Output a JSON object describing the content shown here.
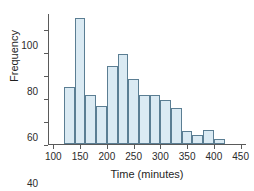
{
  "chart_data": {
    "type": "bar",
    "title": "",
    "subtitle": "",
    "xlabel": "Time (minutes)",
    "ylabel": "Frequency",
    "xlim": [
      90,
      460
    ],
    "ylim": [
      0,
      114
    ],
    "grid": false,
    "legend": null,
    "bin_width": 20,
    "xticks": [
      100,
      150,
      200,
      250,
      300,
      350,
      400,
      450
    ],
    "yticks": [
      0,
      20,
      40,
      60,
      80,
      100
    ],
    "xtick_labels": [
      "100",
      "150",
      "200",
      "250",
      "300",
      "350",
      "400",
      "450"
    ],
    "ytick_labels": [
      "0",
      "20",
      "40",
      "60",
      "80",
      "100"
    ],
    "bins": [
      {
        "start": 120,
        "end": 140,
        "value": 50
      },
      {
        "start": 140,
        "end": 160,
        "value": 110
      },
      {
        "start": 160,
        "end": 180,
        "value": 43
      },
      {
        "start": 180,
        "end": 200,
        "value": 33
      },
      {
        "start": 200,
        "end": 220,
        "value": 68
      },
      {
        "start": 220,
        "end": 240,
        "value": 78
      },
      {
        "start": 240,
        "end": 260,
        "value": 57
      },
      {
        "start": 260,
        "end": 280,
        "value": 43
      },
      {
        "start": 280,
        "end": 300,
        "value": 43
      },
      {
        "start": 300,
        "end": 320,
        "value": 38
      },
      {
        "start": 320,
        "end": 340,
        "value": 31
      },
      {
        "start": 340,
        "end": 360,
        "value": 11
      },
      {
        "start": 360,
        "end": 380,
        "value": 8
      },
      {
        "start": 380,
        "end": 400,
        "value": 12
      },
      {
        "start": 400,
        "end": 420,
        "value": 4
      }
    ],
    "categories": [
      "120-140",
      "140-160",
      "160-180",
      "180-200",
      "200-220",
      "220-240",
      "240-260",
      "260-280",
      "280-300",
      "300-320",
      "320-340",
      "340-360",
      "360-380",
      "380-400",
      "400-420"
    ],
    "values": [
      50,
      110,
      43,
      33,
      68,
      78,
      57,
      43,
      43,
      38,
      31,
      11,
      8,
      12,
      4
    ],
    "colors": {
      "bar_fill": "#daeaf3",
      "bar_stroke": "#5b7e93",
      "axis": "#5a5a5a",
      "text": "#1f1f1f",
      "background": "#ffffff"
    }
  }
}
